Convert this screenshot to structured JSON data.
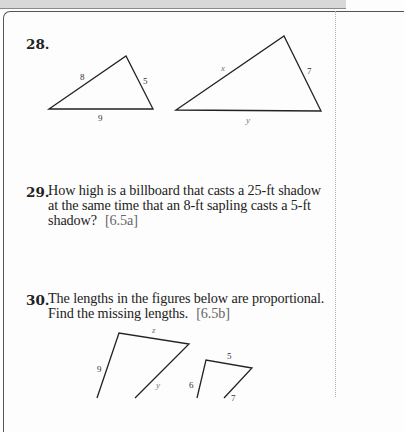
{
  "exercises": [
    {
      "number": "28.",
      "figure": {
        "triangle_1": {
          "sides": [
            "8",
            "5",
            "9"
          ]
        },
        "triangle_2": {
          "sides": [
            "x",
            "7",
            "y"
          ]
        }
      }
    },
    {
      "number": "29.",
      "lines": [
        "How high is a billboard that casts a 25-ft shadow",
        "at the same time that an 8-ft sapling casts a 5-ft",
        "shadow?"
      ],
      "reference": "[6.5a]"
    },
    {
      "number": "30.",
      "lines": [
        "The lengths in the figures below are proportional.",
        "Find the missing lengths."
      ],
      "reference": "[6.5b]",
      "figure": {
        "quad_1": {
          "sides": [
            "z",
            "9",
            "y"
          ]
        },
        "quad_2": {
          "sides": [
            "5",
            "6",
            "7"
          ]
        }
      }
    }
  ],
  "colors": {
    "text": "#222222",
    "reference": "#666666",
    "top_band": "#d8d8d8"
  }
}
